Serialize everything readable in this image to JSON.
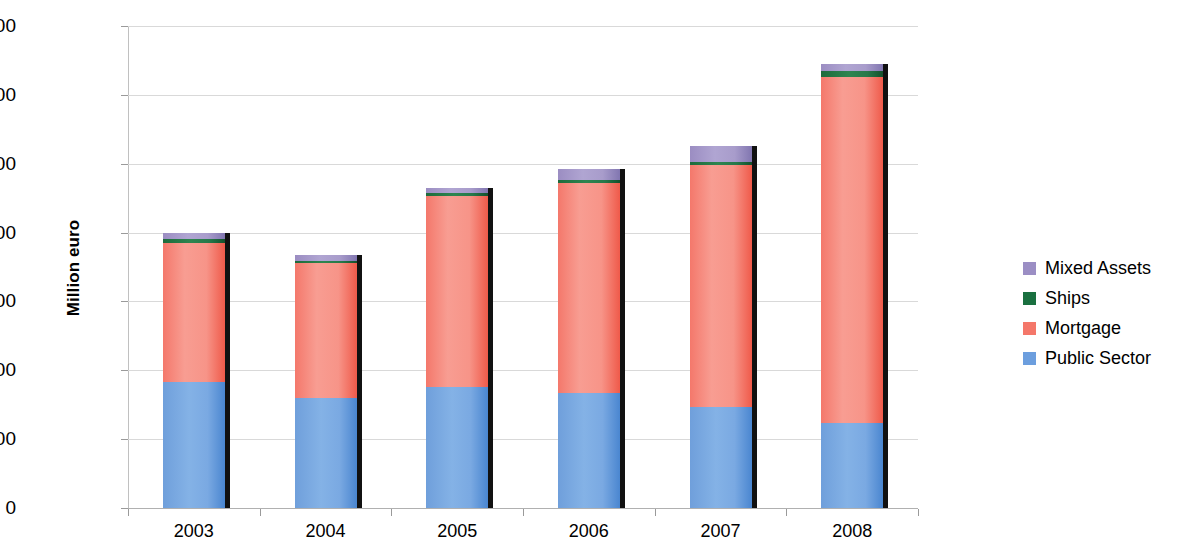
{
  "chart_data": {
    "type": "bar",
    "stacked": true,
    "title": "",
    "xlabel": "",
    "ylabel": "Million euro",
    "categories": [
      "2003",
      "2004",
      "2005",
      "2006",
      "2007",
      "2008"
    ],
    "ylim": [
      0,
      700000
    ],
    "ytick_labels": [
      "0",
      "100000",
      "200000",
      "300000",
      "400000",
      "500000",
      "600000",
      "700000"
    ],
    "ytick_values": [
      0,
      100000,
      200000,
      300000,
      400000,
      500000,
      600000,
      700000
    ],
    "grid": true,
    "legend_position": "right",
    "series": [
      {
        "name": "Public Sector",
        "color": "#6c9ede",
        "values": [
          183000,
          160000,
          176000,
          167000,
          147000,
          123000
        ]
      },
      {
        "name": "Mortgage",
        "color": "#f4776a",
        "values": [
          202000,
          196000,
          277000,
          305000,
          351000,
          503000
        ]
      },
      {
        "name": "Ships",
        "color": "#1a7040",
        "values": [
          5000,
          3000,
          4000,
          4000,
          4000,
          8000
        ]
      },
      {
        "name": "Mixed Assets",
        "color": "#9b8ec4",
        "values": [
          9000,
          9000,
          8000,
          16000,
          24000,
          11000
        ]
      }
    ],
    "totals": [
      399000,
      368000,
      465000,
      492000,
      526000,
      645000
    ],
    "legend_order": [
      "Mixed Assets",
      "Ships",
      "Mortgage",
      "Public Sector"
    ]
  },
  "legend": {
    "items": [
      {
        "label": "Mixed Assets",
        "color": "#9b8ec4"
      },
      {
        "label": "Ships",
        "color": "#1a7040"
      },
      {
        "label": "Mortgage",
        "color": "#f4776a"
      },
      {
        "label": "Public Sector",
        "color": "#6c9ede"
      }
    ]
  }
}
